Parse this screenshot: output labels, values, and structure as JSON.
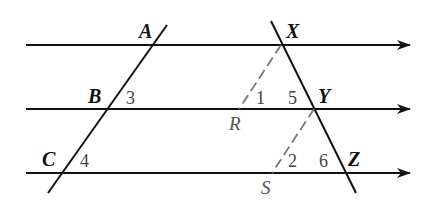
{
  "diagram": {
    "colors": {
      "line": "#111111",
      "dashed": "#777777",
      "point_label": "#111111",
      "aux_label": "#555555",
      "angle_label": "#444444"
    },
    "parallel_lines": [
      {
        "y": 45,
        "x1": 26,
        "x2": 410,
        "arrow": true
      },
      {
        "y": 109,
        "x1": 26,
        "x2": 410,
        "arrow": true
      },
      {
        "y": 173,
        "x1": 26,
        "x2": 410,
        "arrow": true
      }
    ],
    "transversals": [
      {
        "name": "left",
        "x1": 167,
        "y1": 25,
        "x2": 48,
        "y2": 193,
        "passes_through": [
          "A",
          "B",
          "C"
        ]
      },
      {
        "name": "right",
        "x1": 271,
        "y1": 21,
        "x2": 356,
        "y2": 193,
        "passes_through": [
          "X",
          "Y",
          "Z"
        ]
      }
    ],
    "dashed_segments": [
      {
        "from": "X",
        "to": "R"
      },
      {
        "from": "Y",
        "to": "S"
      }
    ],
    "points": {
      "A": {
        "label": "A",
        "x": 139,
        "y": 38
      },
      "B": {
        "label": "B",
        "x": 88,
        "y": 103
      },
      "C": {
        "label": "C",
        "x": 42,
        "y": 166
      },
      "X": {
        "label": "X",
        "x": 286,
        "y": 38
      },
      "Y": {
        "label": "Y",
        "x": 318,
        "y": 103
      },
      "Z": {
        "label": "Z",
        "x": 348,
        "y": 166
      },
      "R": {
        "label": "R",
        "x": 229,
        "y": 130
      },
      "S": {
        "label": "S",
        "x": 261,
        "y": 194
      }
    },
    "angles": [
      {
        "label": "1",
        "x": 256,
        "y": 104
      },
      {
        "label": "2",
        "x": 288,
        "y": 167
      },
      {
        "label": "3",
        "x": 126,
        "y": 104
      },
      {
        "label": "4",
        "x": 80,
        "y": 167
      },
      {
        "label": "5",
        "x": 288,
        "y": 104
      },
      {
        "label": "6",
        "x": 319,
        "y": 167
      }
    ]
  }
}
